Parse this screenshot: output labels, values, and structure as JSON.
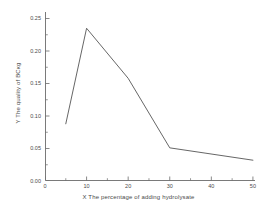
{
  "chart_data": {
    "type": "line",
    "title": "",
    "subtitle": "",
    "xlabel": "X The percentage of adding hydrolysate",
    "ylabel": "Y The quality of BCκg",
    "x": [
      5,
      10,
      20,
      30,
      50
    ],
    "values": [
      0.088,
      0.235,
      0.158,
      0.051,
      0.032
    ],
    "series": [
      {
        "name": "BC quality",
        "x": [
          5,
          10,
          20,
          30,
          50
        ],
        "values": [
          0.088,
          0.235,
          0.158,
          0.051,
          0.032
        ]
      }
    ],
    "xlim": [
      0,
      50.5
    ],
    "ylim": [
      0.0,
      0.26
    ],
    "x_ticks": [
      0,
      10,
      20,
      30,
      40,
      50
    ],
    "x_tick_labels": [
      "0",
      "10",
      "20",
      "30",
      "40",
      "50"
    ],
    "x_minor_ticks": [
      5,
      15,
      25,
      35,
      45
    ],
    "y_ticks": [
      0.0,
      0.05,
      0.1,
      0.15,
      0.2,
      0.25
    ],
    "y_tick_labels": [
      "0.00",
      "0.05",
      "0.10",
      "0.15",
      "0.20",
      "0.25"
    ],
    "grid": false,
    "legend": false,
    "legend_position": "none",
    "line_color": "#555555",
    "background_color": "#ffffff",
    "axis_color": "#6b6b6b",
    "markers": false
  }
}
